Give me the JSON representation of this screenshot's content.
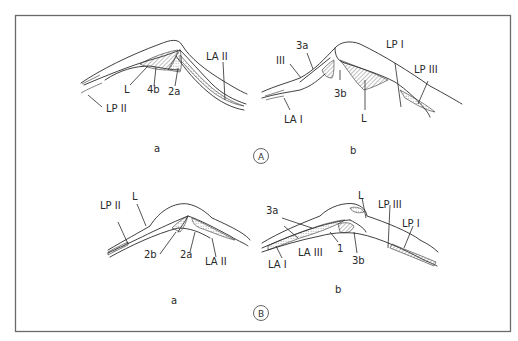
{
  "figure": {
    "panels": [
      {
        "id": "A",
        "marker": "A",
        "subfigures": [
          {
            "id": "a",
            "caption": "a",
            "labels": [
              "L",
              "4b",
              "2a",
              "LA II",
              "LP II"
            ]
          },
          {
            "id": "b",
            "caption": "b",
            "labels": [
              "III",
              "3a",
              "3b",
              "LA I",
              "L",
              "LP I",
              "LP III"
            ]
          }
        ]
      },
      {
        "id": "B",
        "marker": "B",
        "subfigures": [
          {
            "id": "a",
            "caption": "a",
            "labels": [
              "LP II",
              "L",
              "2b",
              "2a",
              "LA II"
            ]
          },
          {
            "id": "b",
            "caption": "b",
            "labels": [
              "3a",
              "LA III",
              "LA I",
              "1",
              "3b",
              "L",
              "LP III",
              "LP I"
            ]
          }
        ]
      }
    ]
  }
}
